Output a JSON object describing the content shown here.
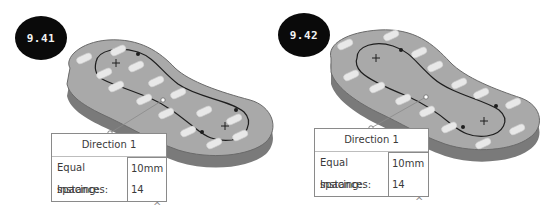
{
  "figures": [
    {
      "label": "9.41",
      "callout": {
        "title": "Direction 1",
        "rows": [
          {
            "label": "Equal spacing:",
            "value": "10mm"
          },
          {
            "label": "Instances:",
            "value": "14"
          }
        ]
      },
      "expand_icon": "chevron-up-icon",
      "expand_glyph": "^",
      "pattern_mode": "instances placed along closed sketch path (inner region)"
    },
    {
      "label": "9.42",
      "callout": {
        "title": "Direction 1",
        "rows": [
          {
            "label": "Equal spacing:",
            "value": "10mm"
          },
          {
            "label": "Instances:",
            "value": "14"
          }
        ]
      },
      "expand_icon": "chevron-up-icon",
      "expand_glyph": "^",
      "pattern_mode": "instances placed outside sketch path (outer region)"
    }
  ],
  "colors": {
    "badge_bg": "#0a0a0a",
    "badge_text": "#f2f2f2",
    "part_top": "#a9a9a9",
    "part_side": "#7a7a7a",
    "slot": "#e8e8e8",
    "sketch_line": "#1e1e1e",
    "callout_border": "#8a8a8a"
  }
}
